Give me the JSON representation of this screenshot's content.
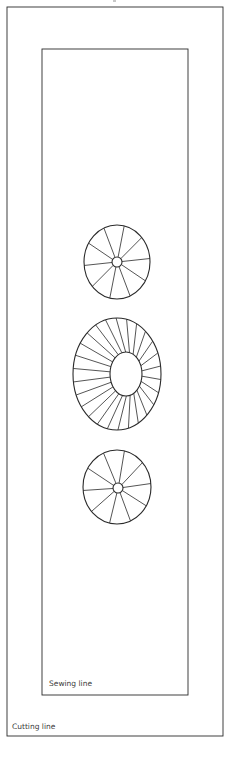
{
  "labels": {
    "sewing_line": "Sewing line",
    "cutting_line": "Cutting line"
  },
  "colors": {
    "stroke": "#2a2a2a",
    "background": "#ffffff"
  },
  "shapes": {
    "cutting_rect": {
      "x": 7,
      "y": 7,
      "w": 216,
      "h": 729
    },
    "sewing_rect": {
      "x": 42,
      "y": 49,
      "w": 146,
      "h": 646
    },
    "wheels": [
      {
        "name": "top-wheel",
        "cx": 117,
        "cy": 262,
        "rx": 33,
        "ry": 37,
        "hub_cx": 117,
        "hub_cy": 262,
        "hub_rx": 5,
        "hub_ry": 5,
        "spokes": 10
      },
      {
        "name": "middle-wheel",
        "cx": 117,
        "cy": 374,
        "rx": 44,
        "ry": 56,
        "hub_cx": 126,
        "hub_cy": 374,
        "hub_rx": 16,
        "hub_ry": 22,
        "spokes": 26
      },
      {
        "name": "bottom-wheel",
        "cx": 117,
        "cy": 487,
        "rx": 34,
        "ry": 37,
        "hub_cx": 118,
        "hub_cy": 488,
        "hub_rx": 5,
        "hub_ry": 5,
        "spokes": 10
      }
    ]
  }
}
